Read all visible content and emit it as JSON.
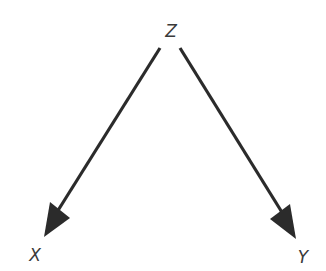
{
  "diagram": {
    "nodes": [
      {
        "id": "Z",
        "label": "Z",
        "x": 171,
        "y": 31
      },
      {
        "id": "X",
        "label": "X",
        "x": 35,
        "y": 255
      },
      {
        "id": "Y",
        "label": "Y",
        "x": 303,
        "y": 257
      }
    ],
    "edges": [
      {
        "from": "Z",
        "to": "X"
      },
      {
        "from": "Z",
        "to": "Y"
      }
    ],
    "colors": {
      "edge": "#2b2b2b",
      "label": "#3a3a3a"
    }
  }
}
